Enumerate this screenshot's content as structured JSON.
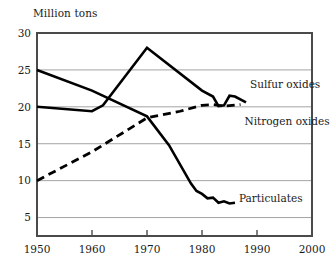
{
  "chart_data": {
    "type": "line",
    "title": "Million tons",
    "xlabel": "",
    "ylabel": "Million tons",
    "xlim": [
      1950,
      2000
    ],
    "ylim": [
      2.5,
      30
    ],
    "yticks": [
      30,
      25,
      20,
      15,
      10,
      5
    ],
    "xticks": [
      1950,
      1960,
      1970,
      1980,
      1990,
      2000
    ],
    "grid": "horizontal",
    "legend_position": "inline-right",
    "series": [
      {
        "name": "Sulfur oxides",
        "style": "solid",
        "label": "Sulfur oxides",
        "x": [
          1950,
          1960,
          1962,
          1970,
          1980,
          1982,
          1983,
          1984,
          1985,
          1986,
          1988
        ],
        "values": [
          20.0,
          19.4,
          20.2,
          28.0,
          22.2,
          21.4,
          20.1,
          20.2,
          21.5,
          21.4,
          20.6
        ]
      },
      {
        "name": "Nitrogen oxides",
        "style": "dashed",
        "label": "Nitrogen oxides",
        "x": [
          1950,
          1960,
          1970,
          1976,
          1980,
          1982,
          1984,
          1987
        ],
        "values": [
          10.0,
          13.9,
          18.5,
          19.4,
          20.2,
          20.3,
          20.1,
          20.3
        ]
      },
      {
        "name": "Particulates",
        "style": "solid",
        "label": "Particulates",
        "x": [
          1950,
          1960,
          1970,
          1974,
          1978,
          1979,
          1980,
          1981,
          1982,
          1983,
          1984,
          1985,
          1986
        ],
        "values": [
          25.0,
          22.2,
          18.7,
          14.8,
          9.6,
          8.6,
          8.2,
          7.6,
          7.7,
          7.0,
          7.2,
          6.9,
          7.0
        ]
      }
    ],
    "series_label_positions": [
      {
        "name": "Sulfur oxides",
        "x": 1988,
        "y": 23.0
      },
      {
        "name": "Nitrogen oxides",
        "x": 1987,
        "y": 18.0
      },
      {
        "name": "Particulates",
        "x": 1986,
        "y": 7.6
      }
    ]
  }
}
